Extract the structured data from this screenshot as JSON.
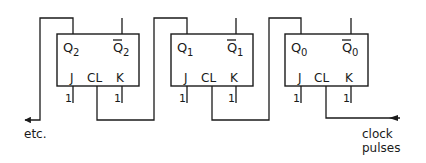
{
  "diagram": {
    "type": "ripple counter (JK flip-flops)",
    "colors": {
      "line": "#1a1a1a",
      "background": "#ffffff"
    },
    "flipflops": [
      {
        "id": "ff2",
        "q": "Q",
        "q_sub": "2",
        "qbar": "Q",
        "qbar_sub": "2",
        "j": "J",
        "cl": "CL",
        "k": "K",
        "j_in": "1",
        "k_in": "1"
      },
      {
        "id": "ff1",
        "q": "Q",
        "q_sub": "1",
        "qbar": "Q",
        "qbar_sub": "1",
        "j": "J",
        "cl": "CL",
        "k": "K",
        "j_in": "1",
        "k_in": "1"
      },
      {
        "id": "ff0",
        "q": "Q",
        "q_sub": "0",
        "qbar": "Q",
        "qbar_sub": "0",
        "j": "J",
        "cl": "CL",
        "k": "K",
        "j_in": "1",
        "k_in": "1"
      }
    ],
    "labels": {
      "etc": "etc.",
      "clock_line1": "clock",
      "clock_line2": "pulses"
    }
  }
}
